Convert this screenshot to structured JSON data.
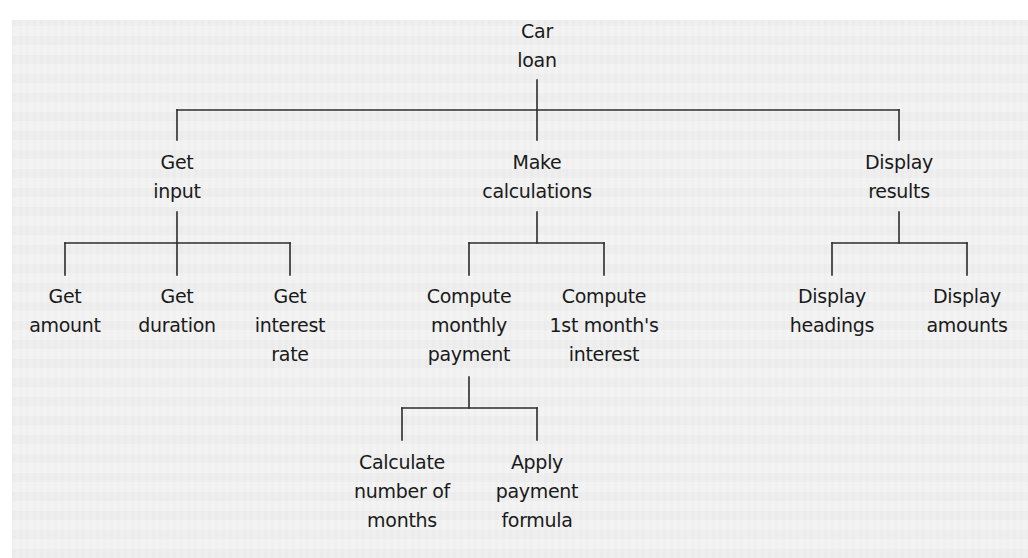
{
  "diagram": {
    "type": "structure-chart",
    "root": {
      "id": "car-loan",
      "lines": [
        "Car",
        "loan"
      ]
    },
    "level1": [
      {
        "id": "get-input",
        "lines": [
          "Get",
          "input"
        ],
        "children": [
          {
            "id": "get-amount",
            "lines": [
              "Get",
              "amount"
            ]
          },
          {
            "id": "get-duration",
            "lines": [
              "Get",
              "duration"
            ]
          },
          {
            "id": "get-interest-rate",
            "lines": [
              "Get",
              "interest",
              "rate"
            ]
          }
        ]
      },
      {
        "id": "make-calculations",
        "lines": [
          "Make",
          "calculations"
        ],
        "children": [
          {
            "id": "compute-monthly-payment",
            "lines": [
              "Compute",
              "monthly",
              "payment"
            ],
            "children": [
              {
                "id": "calculate-number-of-months",
                "lines": [
                  "Calculate",
                  "number of",
                  "months"
                ]
              },
              {
                "id": "apply-payment-formula",
                "lines": [
                  "Apply",
                  "payment",
                  "formula"
                ]
              }
            ]
          },
          {
            "id": "compute-first-month-interest",
            "lines": [
              "Compute",
              "1st month's",
              "interest"
            ]
          }
        ]
      },
      {
        "id": "display-results",
        "lines": [
          "Display",
          "results"
        ],
        "children": [
          {
            "id": "display-headings",
            "lines": [
              "Display",
              "headings"
            ]
          },
          {
            "id": "display-amounts",
            "lines": [
              "Display",
              "amounts"
            ]
          }
        ]
      }
    ]
  }
}
